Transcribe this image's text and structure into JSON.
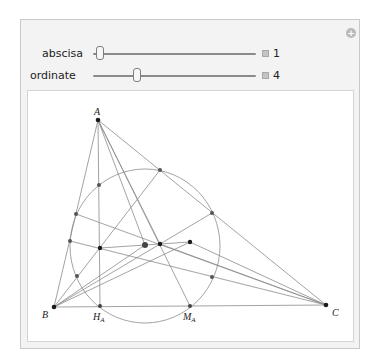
{
  "controls": {
    "add_button": "+",
    "sliders": [
      {
        "label": "abscisa",
        "value": "1"
      },
      {
        "label": "ordinate",
        "value": "4"
      }
    ]
  },
  "diagram": {
    "labels": {
      "A": "A",
      "B": "B",
      "C": "C",
      "H": "H",
      "H_sub": "A",
      "M": "M",
      "M_sub": "A"
    },
    "vertices": {
      "A": [
        98,
        120
      ],
      "B": [
        54,
        307
      ],
      "C": [
        326,
        305
      ]
    },
    "nine_point_circle": {
      "center": [
        145,
        245
      ],
      "rx": 75,
      "ry": 78
    },
    "colors": {
      "line": "#8c8c8c",
      "point": "#1a1a1a",
      "circle_point": "#555555"
    }
  }
}
